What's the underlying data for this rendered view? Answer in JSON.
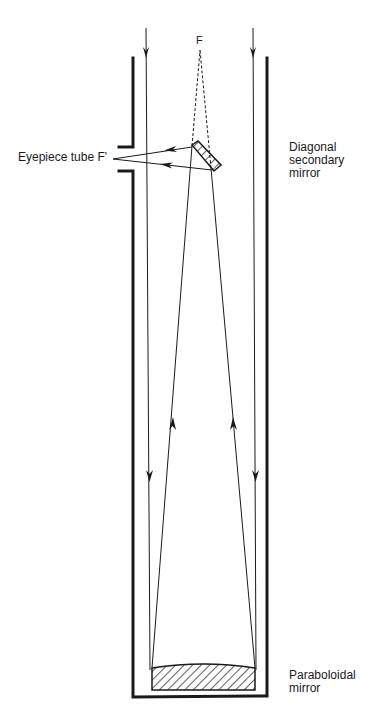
{
  "diagram": {
    "labels": {
      "focus": "F",
      "eyepiece": "Eyepiece tube F'",
      "secondary_line1": "Diagonal",
      "secondary_line2": "secondary",
      "secondary_line3": "mirror",
      "primary_line1": "Paraboloidal",
      "primary_line2": "mirror"
    },
    "colors": {
      "ink": "#1a1a1a",
      "background": "#ffffff"
    }
  }
}
